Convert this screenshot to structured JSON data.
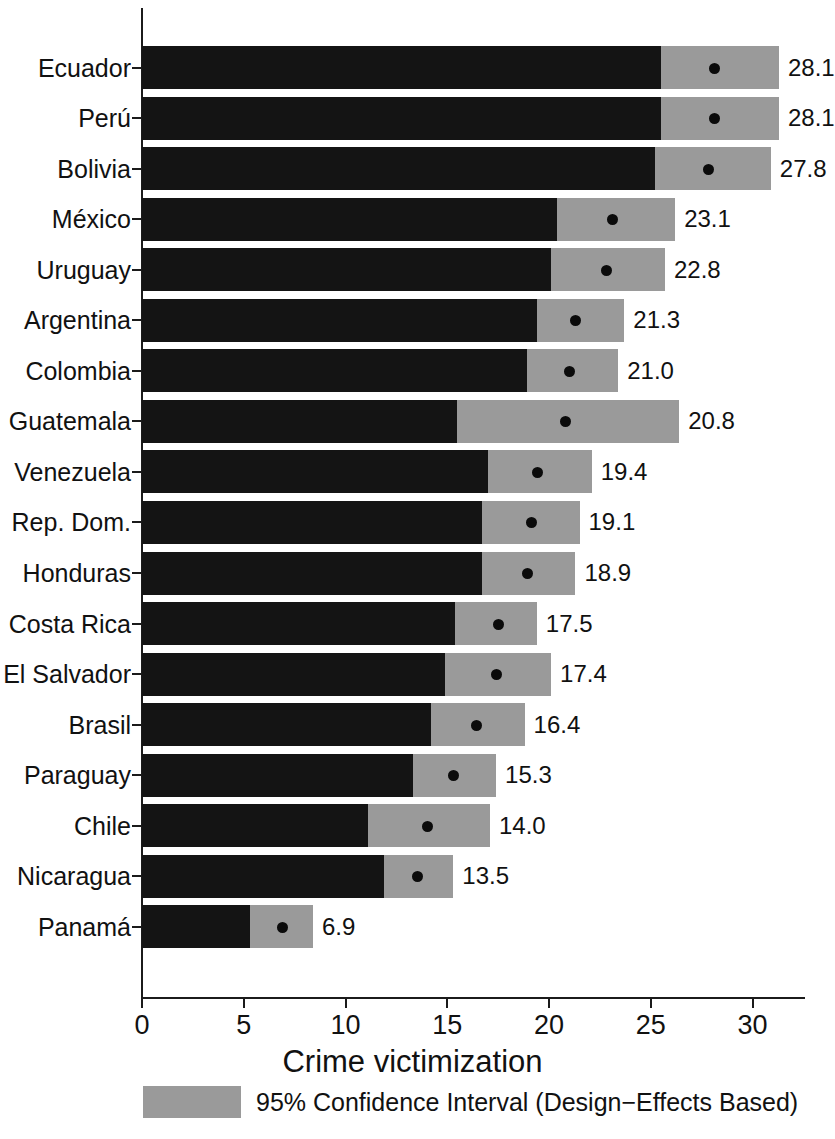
{
  "chart_data": {
    "type": "bar",
    "title": "",
    "xlabel": "Crime victimization",
    "ylabel": "",
    "xlim": [
      0,
      31.5
    ],
    "grid": false,
    "legend_position": "bottom",
    "legend_entries": [
      "95% Confidence Interval (Design−Effects Based)"
    ],
    "x_ticks": [
      0,
      5,
      10,
      15,
      20,
      25,
      30
    ],
    "x_tick_labels": [
      "0",
      "5",
      "10",
      "15",
      "20",
      "25",
      "30"
    ],
    "categories": [
      "Ecuador",
      "Perú",
      "Bolivia",
      "México",
      "Uruguay",
      "Argentina",
      "Colombia",
      "Guatemala",
      "Venezuela",
      "Rep. Dom.",
      "Honduras",
      "Costa Rica",
      "El Salvador",
      "Brasil",
      "Paraguay",
      "Chile",
      "Nicaragua",
      "Panamá"
    ],
    "values": [
      28.1,
      28.1,
      27.8,
      23.1,
      22.8,
      21.3,
      21.0,
      20.8,
      19.4,
      19.1,
      18.9,
      17.5,
      17.4,
      16.4,
      15.3,
      14.0,
      13.5,
      6.9
    ],
    "value_labels": [
      "28.1",
      "28.1",
      "27.8",
      "23.1",
      "22.8",
      "21.3",
      "21.0",
      "20.8",
      "19.4",
      "19.1",
      "18.9",
      "17.5",
      "17.4",
      "16.4",
      "15.3",
      "14.0",
      "13.5",
      "6.9"
    ],
    "ci_lower": [
      25.5,
      25.5,
      25.2,
      20.4,
      20.1,
      19.4,
      18.9,
      15.5,
      17.0,
      16.7,
      16.7,
      15.4,
      14.9,
      14.2,
      13.3,
      11.1,
      11.9,
      5.3
    ],
    "ci_upper": [
      31.3,
      31.3,
      30.9,
      26.2,
      25.7,
      23.7,
      23.4,
      26.4,
      22.1,
      21.5,
      21.3,
      19.4,
      20.1,
      18.8,
      17.4,
      17.1,
      15.3,
      8.4
    ],
    "series": [
      {
        "name": "Crime victimization point estimate",
        "values": [
          28.1,
          28.1,
          27.8,
          23.1,
          22.8,
          21.3,
          21.0,
          20.8,
          19.4,
          19.1,
          18.9,
          17.5,
          17.4,
          16.4,
          15.3,
          14.0,
          13.5,
          6.9
        ]
      }
    ],
    "colors": {
      "bar": "#141414",
      "confidence_interval": "#9a9a9a",
      "point": "#0b0b0b",
      "axis": "#1b1b1b",
      "background": "#ffffff"
    }
  },
  "footer": {
    "axis_title": "Crime victimization",
    "legend_label": "95% Confidence Interval (Design−Effects Based)"
  }
}
